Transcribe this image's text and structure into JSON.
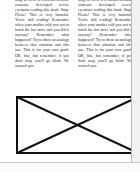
{
  "page": {
    "background_color": "#ffffff",
    "text_color": "#1d1d1d",
    "edge_color": "#b9b9b9",
    "gutter_color": "#f2f2f2"
  },
  "body": {
    "column_count": 2,
    "columns": [
      {
        "id": "left-column",
        "text": "ning we need is a lawsuit because someone developed severe eyestrain reading this book. Stop. Please! This is very harmful. You're still reading! Remember when your mother told you not to touch the hot stove and you did it anyway? Remember what happened? Try to draw an analogy between that situation and this one. This is for your own good. OK, fine, but remember, if you don't stop, you'll go blind. We warned you."
      },
      {
        "id": "right-column",
        "text": "ning we need is a lawsuit because someone developed severe eyestrain reading this book. Stop. Please! This is very harmful. You're still reading! Remember when your mother told you not to touch the hot stove and you did it anyway? Remember what happened? Try to draw an analogy between that situation and this one. This is for your own good. OK, fine, but remember, if you don't stop, you'll go blind. We warned you."
      }
    ]
  },
  "figure": {
    "type": "missing-image-placeholder",
    "border_color": "#111111",
    "fill_color": "#ffffff",
    "border_width": 2,
    "diagonal_width": 2,
    "caption": ""
  }
}
